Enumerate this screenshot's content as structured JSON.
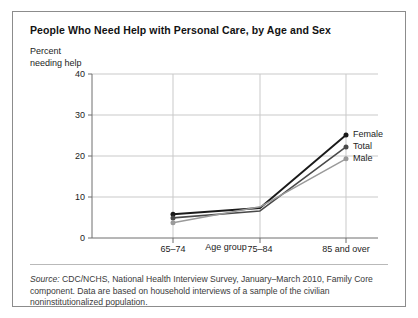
{
  "figure": {
    "title": "People Who Need Help with Personal Care, by Age and Sex",
    "source_label": "Source:",
    "source_text": " CDC/NCHS, National Health Interview Survey, January–March 2010, Family Core component. Data are based on household interviews of a sample of the civilian noninstitutionalized population."
  },
  "chart_data": {
    "type": "line",
    "title": "People Who Need Help with Personal Care, by Age and Sex",
    "xlabel": "Age group",
    "ylabel": "Percent needing help",
    "categories": [
      "65–74",
      "75–84",
      "85 and over"
    ],
    "series": [
      {
        "name": "Female",
        "values": [
          5.8,
          7.3,
          25.1
        ],
        "color": "#1a1a1a"
      },
      {
        "name": "Total",
        "values": [
          4.9,
          6.6,
          22.2
        ],
        "color": "#4a4a4a"
      },
      {
        "name": "Male",
        "values": [
          3.7,
          7.6,
          19.3
        ],
        "color": "#9a9a9a"
      }
    ],
    "ylim": [
      0,
      40
    ],
    "yticks": [
      0,
      10,
      20,
      30,
      40
    ],
    "ytick_labels": [
      "0",
      "10",
      "20",
      "30",
      "40"
    ],
    "grid": "horizontal-and-vertical",
    "legend_position": "right-line-end"
  }
}
